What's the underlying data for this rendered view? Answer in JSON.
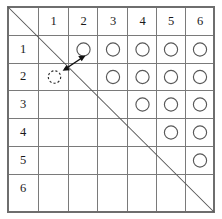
{
  "figure": {
    "type": "matrix-grid",
    "rows": 6,
    "cols": 6,
    "corner_cell_label": "",
    "column_headers": [
      "1",
      "2",
      "3",
      "4",
      "5",
      "6"
    ],
    "row_headers": [
      "1",
      "2",
      "3",
      "4",
      "5",
      "6"
    ],
    "diagonal": {
      "name": "main-diagonal",
      "from": "top-left-corner",
      "to": "bottom-right-corner",
      "color": "#555555"
    },
    "markers": [
      {
        "row": 1,
        "col": 2,
        "style": "solid"
      },
      {
        "row": 1,
        "col": 3,
        "style": "solid"
      },
      {
        "row": 1,
        "col": 4,
        "style": "solid"
      },
      {
        "row": 1,
        "col": 5,
        "style": "solid"
      },
      {
        "row": 1,
        "col": 6,
        "style": "solid"
      },
      {
        "row": 2,
        "col": 1,
        "style": "dashed"
      },
      {
        "row": 2,
        "col": 3,
        "style": "solid"
      },
      {
        "row": 2,
        "col": 4,
        "style": "solid"
      },
      {
        "row": 2,
        "col": 5,
        "style": "solid"
      },
      {
        "row": 2,
        "col": 6,
        "style": "solid"
      },
      {
        "row": 3,
        "col": 4,
        "style": "solid"
      },
      {
        "row": 3,
        "col": 5,
        "style": "solid"
      },
      {
        "row": 3,
        "col": 6,
        "style": "solid"
      },
      {
        "row": 4,
        "col": 5,
        "style": "solid"
      },
      {
        "row": 4,
        "col": 6,
        "style": "solid"
      },
      {
        "row": 5,
        "col": 6,
        "style": "solid"
      }
    ],
    "swap_arrow": {
      "name": "double-headed-arrow",
      "from": {
        "row": 2,
        "col": 1
      },
      "to": {
        "row": 1,
        "col": 2
      },
      "double_headed": true,
      "color": "#111111"
    },
    "colors": {
      "grid": "#7a7a7a",
      "border": "#6e6e6e",
      "marker": "#585858",
      "marker_dashed": "#2b2b2b",
      "text": "#1a1a1a",
      "background": "#ffffff"
    }
  }
}
